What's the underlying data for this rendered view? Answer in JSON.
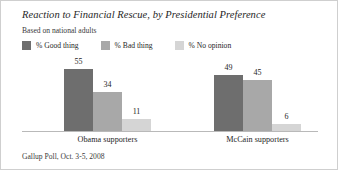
{
  "title": "Reaction to Financial Rescue, by Presidential Preference",
  "subtitle": "Based on national adults",
  "source": "Gallup Poll, Oct. 3-5, 2008",
  "legend": [
    {
      "label": "% Good thing",
      "color": "#6e6e6e",
      "swatch_name": "legend-swatch-good-thing"
    },
    {
      "label": "% Bad thing",
      "color": "#a8a8a8",
      "swatch_name": "legend-swatch-bad-thing"
    },
    {
      "label": "% No opinion",
      "color": "#d5d5d5",
      "swatch_name": "legend-swatch-no-opinion"
    }
  ],
  "chart_data": {
    "type": "bar",
    "title": "Reaction to Financial Rescue, by Presidential Preference",
    "subtitle": "Based on national adults",
    "xlabel": "",
    "ylabel": "",
    "ylim": [
      0,
      60
    ],
    "grid": false,
    "legend_position": "top-left",
    "categories": [
      "Obama supporters",
      "McCain supporters"
    ],
    "series": [
      {
        "name": "% Good thing",
        "color": "#6e6e6e",
        "values": [
          55,
          49
        ]
      },
      {
        "name": "% Bad thing",
        "color": "#a8a8a8",
        "values": [
          34,
          45
        ]
      },
      {
        "name": "% No opinion",
        "color": "#d5d5d5",
        "values": [
          11,
          6
        ]
      }
    ],
    "annotations": [
      "Gallup Poll, Oct. 3-5, 2008"
    ]
  }
}
